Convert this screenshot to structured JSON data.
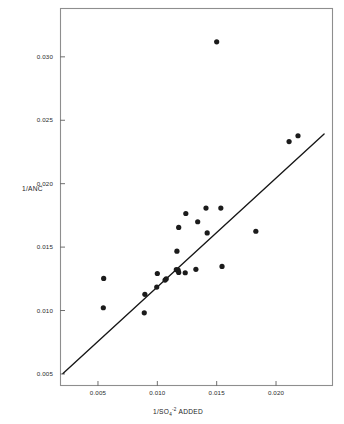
{
  "chart_data": {
    "type": "scatter",
    "title": "",
    "subtitle": "",
    "xlabel": "1/SO4-2 ADDED",
    "xlabel_parts": {
      "base": "1/SO",
      "subscript": "4",
      "superscript": "-2",
      "suffix": " ADDED"
    },
    "ylabel": "1/ANC",
    "xlim": [
      0.0018,
      0.0248
    ],
    "ylim": [
      0.00405,
      0.03385
    ],
    "xticks": [
      0.005,
      0.01,
      0.015,
      0.02
    ],
    "xtick_labels": [
      "0.005",
      "0.010",
      "0.015",
      "0.020"
    ],
    "yticks": [
      0.005,
      0.01,
      0.015,
      0.02,
      0.025,
      0.03
    ],
    "ytick_labels": [
      "0.005",
      "0.010",
      "0.015",
      "0.020",
      "0.025",
      "0.030"
    ],
    "grid": false,
    "legend": "none",
    "marker_color": "#1b1b1b",
    "line_color": "#161616",
    "frame_color": "#8e8e8e",
    "points": [
      {
        "x": 0.00548,
        "y": 0.01253
      },
      {
        "x": 0.00545,
        "y": 0.01022
      },
      {
        "x": 0.00895,
        "y": 0.01128
      },
      {
        "x": 0.0089,
        "y": 0.00982
      },
      {
        "x": 0.00995,
        "y": 0.01185
      },
      {
        "x": 0.01,
        "y": 0.01292
      },
      {
        "x": 0.01065,
        "y": 0.0124
      },
      {
        "x": 0.01075,
        "y": 0.0125
      },
      {
        "x": 0.0116,
        "y": 0.01322
      },
      {
        "x": 0.01175,
        "y": 0.01318
      },
      {
        "x": 0.0118,
        "y": 0.013
      },
      {
        "x": 0.01165,
        "y": 0.01468
      },
      {
        "x": 0.0118,
        "y": 0.01655
      },
      {
        "x": 0.01235,
        "y": 0.01298
      },
      {
        "x": 0.0124,
        "y": 0.01765
      },
      {
        "x": 0.01325,
        "y": 0.01325
      },
      {
        "x": 0.0134,
        "y": 0.017
      },
      {
        "x": 0.0141,
        "y": 0.01808
      },
      {
        "x": 0.0142,
        "y": 0.01612
      },
      {
        "x": 0.015,
        "y": 0.03118
      },
      {
        "x": 0.01535,
        "y": 0.01808
      },
      {
        "x": 0.01545,
        "y": 0.01348
      },
      {
        "x": 0.0183,
        "y": 0.01625
      },
      {
        "x": 0.0211,
        "y": 0.02332
      },
      {
        "x": 0.02185,
        "y": 0.02378
      }
    ],
    "fit_line": {
      "x1": 0.00205,
      "y1": 0.00503,
      "x2": 0.02405,
      "y2": 0.02392,
      "description": "least-squares regression line"
    }
  },
  "axes": {
    "plot_left_px": 60,
    "plot_right_px": 333,
    "plot_top_px": 8,
    "plot_bottom_px": 386
  }
}
